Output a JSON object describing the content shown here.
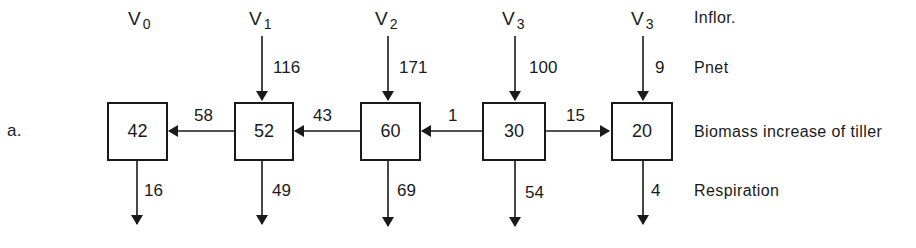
{
  "panel_label": "a.",
  "row_labels": {
    "inflor": "Inflor.",
    "pnet": "Pnet",
    "biomass": "Biomass increase of tiller",
    "respiration": "Respiration"
  },
  "stages": [
    {
      "v_base": "V",
      "v_sub": "0",
      "pnet": null,
      "biomass": "42",
      "respiration": "16"
    },
    {
      "v_base": "V",
      "v_sub": "1",
      "pnet": "116",
      "biomass": "52",
      "respiration": "49"
    },
    {
      "v_base": "V",
      "v_sub": "2",
      "pnet": "171",
      "biomass": "60",
      "respiration": "69"
    },
    {
      "v_base": "V",
      "v_sub": "3",
      "pnet": "100",
      "biomass": "30",
      "respiration": "54"
    },
    {
      "v_base": "V",
      "v_sub": "3",
      "pnet": "9",
      "biomass": "20",
      "respiration": "4"
    }
  ],
  "transfers": [
    {
      "from": "52",
      "to": "42",
      "value": "58",
      "direction": "left"
    },
    {
      "from": "60",
      "to": "52",
      "value": "43",
      "direction": "left"
    },
    {
      "from": "30",
      "to": "60",
      "value": "1",
      "direction": "left"
    },
    {
      "from": "30",
      "to": "20",
      "value": "15",
      "direction": "right"
    }
  ],
  "colors": {
    "ink": "#1a1a1a",
    "background": "#ffffff"
  }
}
